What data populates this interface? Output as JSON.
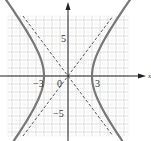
{
  "chart_data": {
    "type": "line",
    "title": "",
    "xlabel": "x",
    "ylabel": "y",
    "xlim": [
      -7.5,
      7.5
    ],
    "ylim": [
      -7.5,
      7.5
    ],
    "grid": true,
    "legend": null,
    "x_tick_labels": [
      "-3",
      "0",
      "3"
    ],
    "y_tick_labels": [
      "5",
      "-5"
    ],
    "series": [
      {
        "name": "hyperbola",
        "equation": "x^2/9 - y^2/16 = 1",
        "style": "solid",
        "color": "#777777",
        "vertices": [
          [
            -3,
            0
          ],
          [
            3,
            0
          ]
        ]
      },
      {
        "name": "asymptote-1",
        "equation": "y = 4/3 x",
        "style": "dashed",
        "color": "#333333"
      },
      {
        "name": "asymptote-2",
        "equation": "y = -4/3 x",
        "style": "dashed",
        "color": "#333333"
      }
    ]
  },
  "labels": {
    "x_axis": "x",
    "tick_neg3": "−3",
    "tick_0": "0",
    "tick_3": "3",
    "tick_5": "5",
    "tick_neg5": "−5"
  },
  "colors": {
    "grid": "#cccccc",
    "axis": "#222222",
    "curve": "#777777",
    "asymptote": "#333333"
  }
}
